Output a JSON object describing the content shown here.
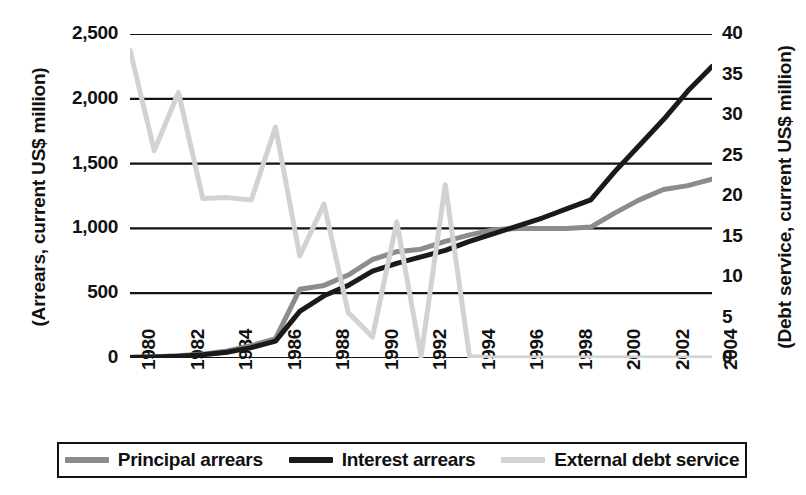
{
  "chart_data": {
    "type": "line",
    "title": "",
    "subtitle": "",
    "xlabel": "",
    "ylabel": "(Arrears, current US$ million)",
    "ylabel_right": "(Debt service, current US$ million)",
    "grid": true,
    "legend_position": "bottom",
    "x": [
      1980,
      1981,
      1982,
      1983,
      1984,
      1985,
      1986,
      1987,
      1988,
      1989,
      1990,
      1991,
      1992,
      1993,
      1994,
      1995,
      1996,
      1997,
      1998,
      1999,
      2000,
      2001,
      2002,
      2003,
      2004
    ],
    "xtick_labels": [
      "1980",
      "1982",
      "1984",
      "1986",
      "1988",
      "1990",
      "1992",
      "1994",
      "1996",
      "1998",
      "2000",
      "2002",
      "2004"
    ],
    "xtick_values": [
      1980,
      1982,
      1984,
      1986,
      1988,
      1990,
      1992,
      1994,
      1996,
      1998,
      2000,
      2002,
      2004
    ],
    "xlim": [
      1980,
      2004
    ],
    "ylim": [
      0,
      2500
    ],
    "ytick_labels": [
      "0",
      "500",
      "1,000",
      "1,500",
      "2,000",
      "2,500"
    ],
    "ytick_values": [
      0,
      500,
      1000,
      1500,
      2000,
      2500
    ],
    "ylim_right": [
      0,
      40
    ],
    "ytick_labels_right": [
      "0",
      "5",
      "10",
      "15",
      "20",
      "25",
      "30",
      "35",
      "40"
    ],
    "ytick_values_right": [
      0,
      5,
      10,
      15,
      20,
      25,
      30,
      35,
      40
    ],
    "series": [
      {
        "name": "Principal arrears",
        "axis": "left",
        "color": "#8c8c8c",
        "values": [
          5,
          10,
          18,
          30,
          55,
          95,
          150,
          530,
          560,
          640,
          760,
          820,
          840,
          900,
          950,
          990,
          1000,
          1000,
          1000,
          1010,
          1120,
          1220,
          1300,
          1330,
          1380
        ]
      },
      {
        "name": "Interest arrears",
        "axis": "left",
        "color": "#1a1a1a",
        "values": [
          4,
          8,
          14,
          25,
          45,
          80,
          130,
          360,
          480,
          560,
          670,
          730,
          780,
          830,
          900,
          960,
          1020,
          1080,
          1150,
          1220,
          1440,
          1640,
          1840,
          2060,
          2250
        ]
      },
      {
        "name": "External debt service",
        "axis": "right",
        "color": "#d2d2d2",
        "values": [
          38.0,
          25.6,
          32.8,
          19.7,
          19.8,
          19.5,
          28.5,
          12.6,
          19.0,
          5.6,
          2.6,
          16.8,
          0.2,
          21.4,
          0.2,
          0.0,
          0.0,
          0.0,
          0.0,
          0.0,
          0.0,
          0.0,
          0.0,
          0.0,
          0.0
        ]
      }
    ]
  },
  "legend": {
    "entries": [
      {
        "label": "Principal arrears",
        "color": "#8c8c8c"
      },
      {
        "label": "Interest arrears",
        "color": "#1a1a1a"
      },
      {
        "label": "External debt service",
        "color": "#d2d2d2"
      }
    ]
  }
}
